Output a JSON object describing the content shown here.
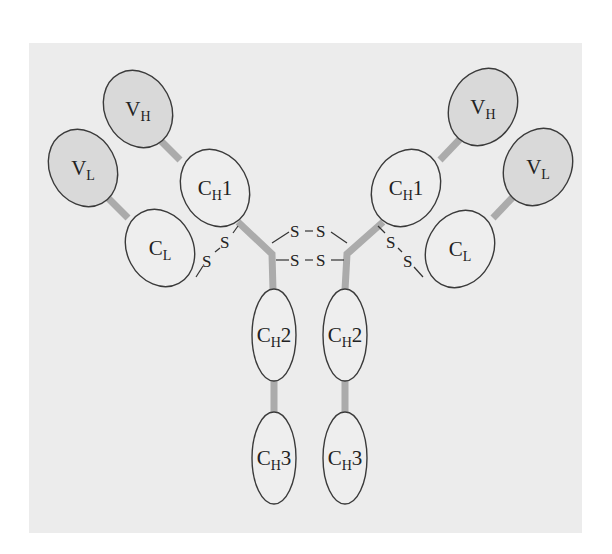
{
  "colors": {
    "page_background": "#ffffff",
    "panel_background": "#ececec",
    "variable_domain_fill": "#d9d9d9",
    "constant_domain_fill": "#eeeeee",
    "outline": "#3a3a3a",
    "connector": "#ababab",
    "text": "#222222"
  },
  "panel": {
    "x": 29,
    "y": 43,
    "width": 553,
    "height": 490
  },
  "domains": [
    {
      "id": "left-vh",
      "main": "V",
      "sub": "H",
      "suffix": "",
      "variable": true,
      "cx": 138,
      "cy": 109,
      "rx": 33,
      "ry": 40,
      "rotate": -28
    },
    {
      "id": "left-vl",
      "main": "V",
      "sub": "L",
      "suffix": "",
      "variable": true,
      "cx": 83,
      "cy": 168,
      "rx": 33,
      "ry": 40,
      "rotate": -28
    },
    {
      "id": "left-ch1",
      "main": "C",
      "sub": "H",
      "suffix": "1",
      "variable": false,
      "cx": 215,
      "cy": 188,
      "rx": 33,
      "ry": 40,
      "rotate": -28
    },
    {
      "id": "left-cl",
      "main": "C",
      "sub": "L",
      "suffix": "",
      "variable": false,
      "cx": 160,
      "cy": 248,
      "rx": 33,
      "ry": 40,
      "rotate": -28
    },
    {
      "id": "left-ch2",
      "main": "C",
      "sub": "H",
      "suffix": "2",
      "variable": false,
      "cx": 274,
      "cy": 335,
      "rx": 22,
      "ry": 46,
      "rotate": 0
    },
    {
      "id": "left-ch3",
      "main": "C",
      "sub": "H",
      "suffix": "3",
      "variable": false,
      "cx": 274,
      "cy": 458,
      "rx": 22,
      "ry": 46,
      "rotate": 0
    },
    {
      "id": "right-vh",
      "main": "V",
      "sub": "H",
      "suffix": "",
      "variable": true,
      "cx": 483,
      "cy": 107,
      "rx": 33,
      "ry": 40,
      "rotate": 28
    },
    {
      "id": "right-vl",
      "main": "V",
      "sub": "L",
      "suffix": "",
      "variable": true,
      "cx": 538,
      "cy": 167,
      "rx": 33,
      "ry": 40,
      "rotate": 28
    },
    {
      "id": "right-ch1",
      "main": "C",
      "sub": "H",
      "suffix": "1",
      "variable": false,
      "cx": 406,
      "cy": 188,
      "rx": 33,
      "ry": 40,
      "rotate": 28
    },
    {
      "id": "right-cl",
      "main": "C",
      "sub": "L",
      "suffix": "",
      "variable": false,
      "cx": 460,
      "cy": 249,
      "rx": 33,
      "ry": 40,
      "rotate": 28
    },
    {
      "id": "right-ch2",
      "main": "C",
      "sub": "H",
      "suffix": "2",
      "variable": false,
      "cx": 345,
      "cy": 335,
      "rx": 22,
      "ry": 46,
      "rotate": 0
    },
    {
      "id": "right-ch3",
      "main": "C",
      "sub": "H",
      "suffix": "3",
      "variable": false,
      "cx": 345,
      "cy": 458,
      "rx": 22,
      "ry": 46,
      "rotate": 0
    }
  ],
  "disulfide_labels": {
    "hinge_top_left": "S",
    "hinge_top_right": "S",
    "hinge_bottom_left": "S",
    "hinge_bottom_right": "S",
    "left_interchain_upper": "S",
    "left_interchain_lower": "S",
    "right_interchain_upper": "S",
    "right_interchain_lower": "S"
  }
}
